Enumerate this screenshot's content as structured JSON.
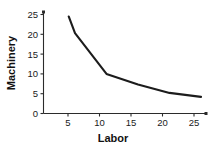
{
  "chart_data": {
    "type": "line",
    "title": "",
    "subtitle": "",
    "xlabel": "Labor",
    "ylabel": "Machinery",
    "xlim": [
      0,
      26.5
    ],
    "ylim": [
      0,
      26
    ],
    "grid": false,
    "legend": null,
    "annotations": [],
    "line_color": "#1c1c1c",
    "axis_color": "#2b2b2b",
    "background": "#ffffff",
    "xticks": [
      5,
      10,
      15,
      20,
      25
    ],
    "yticks": [
      0,
      5,
      10,
      15,
      20,
      25
    ],
    "xtick_labels": [
      "5",
      "10",
      "15",
      "20",
      "25"
    ],
    "ytick_labels": [
      "0",
      "5",
      "10",
      "15",
      "20",
      "25"
    ],
    "series": [
      {
        "name": "isoquant",
        "x": [
          4.0,
          5.0,
          10.0,
          15.0,
          20.0,
          25.0
        ],
        "values": [
          24.5,
          20.3,
          10.0,
          7.3,
          5.2,
          4.2
        ]
      }
    ]
  },
  "axis_labels": {
    "x_title": "Labor",
    "y_title": "Machinery"
  },
  "ticks": {
    "x": [
      "5",
      "10",
      "15",
      "20",
      "25"
    ],
    "y": [
      "0",
      "5",
      "10",
      "15",
      "20",
      "25"
    ]
  }
}
